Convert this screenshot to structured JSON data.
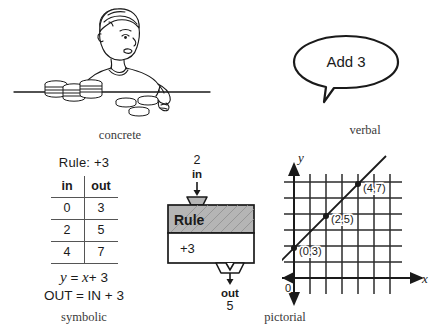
{
  "representations": {
    "concrete": {
      "caption": "concrete",
      "illustration": "boy-with-counters-at-table"
    },
    "verbal": {
      "caption": "verbal",
      "bubble_text": "Add 3"
    },
    "symbolic": {
      "caption": "symbolic",
      "rule_line": "Rule: +3",
      "table": {
        "headers": [
          "in",
          "out"
        ],
        "rows": [
          [
            "0",
            "3"
          ],
          [
            "2",
            "5"
          ],
          [
            "4",
            "7"
          ]
        ]
      },
      "equation_var": "y = x+3",
      "equation_var_lhs": "y",
      "equation_var_eq": " = ",
      "equation_var_rhs_var": "x",
      "equation_var_rhs_rest": "+ 3",
      "equation_words": "OUT = IN + 3"
    },
    "pictorial": {
      "caption": "pictorial",
      "machine": {
        "input_value": "2",
        "input_label": "in",
        "box_title": "Rule",
        "box_operation": "+3",
        "output_label": "out",
        "output_value": "5"
      },
      "graph": {
        "x_axis_label": "x",
        "y_axis_label": "y",
        "origin_label": "0",
        "points": [
          {
            "label": "(0,3)",
            "x": 0,
            "y": 3
          },
          {
            "label": "(2,5)",
            "x": 2,
            "y": 5
          },
          {
            "label": "(4,7)",
            "x": 4,
            "y": 7
          }
        ],
        "line_equation": "y = x + 3",
        "grid_columns": 7,
        "grid_rows": 7
      }
    }
  },
  "colors": {
    "ink": "#1a1a1a",
    "rule_shade": "#b5b5b5",
    "grid": "#2b2b2b",
    "caption": "#3a3a3a"
  }
}
